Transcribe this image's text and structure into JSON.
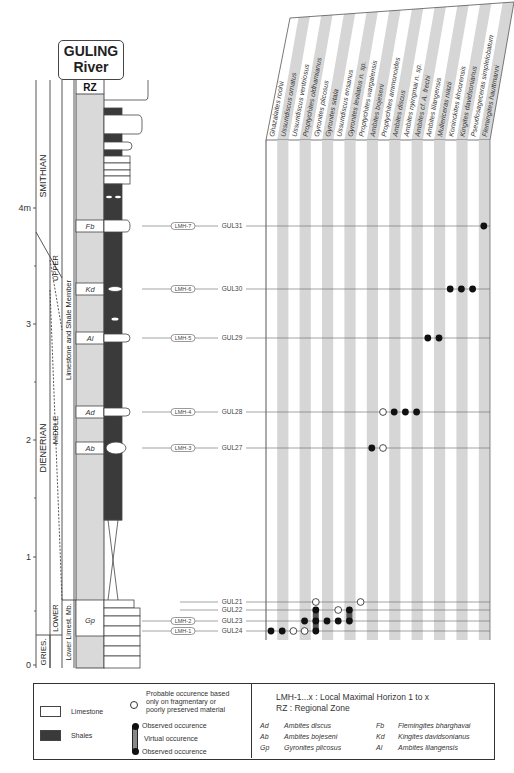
{
  "title": {
    "line1": "GULING",
    "line2": "River"
  },
  "rz_header": "RZ",
  "stages": [
    {
      "label": "SMITHIAN"
    },
    {
      "label": "DIENERIAN"
    },
    {
      "label": "GRIES."
    }
  ],
  "substages": [
    {
      "label": "UPPER"
    },
    {
      "label": "MIDDLE"
    },
    {
      "label": "LOWER"
    }
  ],
  "members": [
    {
      "label": "Limestone and Shale Member"
    },
    {
      "label": "Lower Limest. Mb."
    }
  ],
  "scale": {
    "unit_label": "4m",
    "ticks": [
      {
        "value": "0",
        "y": 665
      },
      {
        "value": "1",
        "y": 557
      },
      {
        "value": "2",
        "y": 440
      },
      {
        "value": "3",
        "y": 324
      },
      {
        "value": "4m",
        "y": 208
      }
    ]
  },
  "zones": [
    {
      "code": "Fb",
      "y": 226
    },
    {
      "code": "Kd",
      "y": 289
    },
    {
      "code": "Al",
      "y": 338
    },
    {
      "code": "Ad",
      "y": 412
    },
    {
      "code": "Ab",
      "y": 448
    },
    {
      "code": "Gp",
      "y": 620
    }
  ],
  "species": [
    "Ghazalaites roohii",
    "Ussuridiscus ornatus",
    "Ussuridiscus ventriosus",
    "Proptychites oldhamianus",
    "Gyronites plicosus",
    "Gyronites sitala",
    "Ussuridiscus ensanus",
    "Gyronites levilatus n. sp.",
    "Proptychites wargalensis",
    "Ambites bojeseni",
    "Proptychites ammonoides",
    "Ambites discus",
    "Ambites nyingmai n. sp.",
    "Ambites cf. A. frechi",
    "Ambites lilangensis",
    "Mullericeras niazii",
    "Koninckites khoorensis",
    "Kingites davidsonianus",
    "Pseudosageceras simplelobatum",
    "Flemingites hauttmanni"
  ],
  "horizons": [
    {
      "lmh": "LMH-7",
      "gul": "GUL31",
      "y": 226
    },
    {
      "lmh": "LMH-6",
      "gul": "GUL30",
      "y": 289
    },
    {
      "lmh": "LMH-5",
      "gul": "GUL29",
      "y": 338
    },
    {
      "lmh": "LMH-4",
      "gul": "GUL28",
      "y": 412
    },
    {
      "lmh": "LMH-3",
      "gul": "GUL27",
      "y": 448
    },
    {
      "lmh": "",
      "gul": "GUL21",
      "y": 602
    },
    {
      "lmh": "",
      "gul": "GUL22",
      "y": 610
    },
    {
      "lmh": "LMH-2",
      "gul": "GUL23",
      "y": 621
    },
    {
      "lmh": "LMH-1",
      "gul": "GUL24",
      "y": 631
    }
  ],
  "chart_data": {
    "type": "range-chart",
    "title": "GULING River",
    "ylabel": "Thickness (m)",
    "ylim": [
      0,
      4.8
    ],
    "taxa": [
      "Ghazalaites roohii",
      "Ussuridiscus ornatus",
      "Ussuridiscus ventriosus",
      "Proptychites oldhamianus",
      "Gyronites plicosus",
      "Gyronites sitala",
      "Ussuridiscus ensanus",
      "Gyronites levilatus n. sp.",
      "Proptychites wargalensis",
      "Ambites bojeseni",
      "Proptychites ammonoides",
      "Ambites discus",
      "Ambites nyingmai n. sp.",
      "Ambites cf. A. frechi",
      "Ambites lilangensis",
      "Mullericeras niazii",
      "Koninckites khoorensis",
      "Kingites davidsonianus",
      "Pseudosageceras simplelobatum",
      "Flemingites hauttmanni"
    ],
    "occurrences": [
      {
        "sample": "GUL24",
        "horizon": "LMH-1",
        "observed": [
          0,
          1,
          4
        ],
        "probable": [
          2,
          3
        ]
      },
      {
        "sample": "GUL23",
        "horizon": "LMH-2",
        "observed": [
          3,
          4,
          5,
          6,
          7
        ],
        "probable": []
      },
      {
        "sample": "GUL22",
        "horizon": "",
        "observed": [
          4,
          7
        ],
        "probable": [
          6
        ]
      },
      {
        "sample": "GUL21",
        "horizon": "",
        "observed": [],
        "probable": [
          4,
          8
        ]
      },
      {
        "sample": "GUL27",
        "horizon": "LMH-3",
        "observed": [
          9
        ],
        "probable": [
          10
        ]
      },
      {
        "sample": "GUL28",
        "horizon": "LMH-4",
        "observed": [
          11,
          12,
          13
        ],
        "probable": [
          10
        ]
      },
      {
        "sample": "GUL29",
        "horizon": "LMH-5",
        "observed": [
          14,
          15
        ],
        "probable": []
      },
      {
        "sample": "GUL30",
        "horizon": "LMH-6",
        "observed": [
          16,
          17,
          18
        ],
        "probable": []
      },
      {
        "sample": "GUL31",
        "horizon": "LMH-7",
        "observed": [
          19
        ],
        "probable": []
      }
    ]
  },
  "legend": {
    "limestone": "Limestone",
    "shales": "Shales",
    "probable": "Probable occurence based only on fragmentary or poorly preserved material",
    "probable_l1": "Probable occurence based",
    "probable_l2": "only on fragmentary or",
    "probable_l3": "poorly preserved material",
    "observed_top": "Observed occurence",
    "virtual": "Virtual occurence",
    "observed_bottom": "Observed occurence",
    "lmh_def": "LMH-1...x : Local Maximal Horizon 1 to x",
    "rz_def": "RZ : Regional Zone",
    "abbreviations": [
      {
        "code": "Ad",
        "name": "Ambites discus"
      },
      {
        "code": "Ab",
        "name": "Ambites bojeseni"
      },
      {
        "code": "Gp",
        "name": "Gyronites plicosus"
      },
      {
        "code": "Fb",
        "name": "Flemingites bharghavai"
      },
      {
        "code": "Kd",
        "name": "Kingites davidsonianus"
      },
      {
        "code": "Al",
        "name": "Ambites lilangensis"
      }
    ]
  },
  "colors": {
    "stripe": "#d6d6d6",
    "rz_fill": "#d9d9d9",
    "shale": "#3a3a3a",
    "line": "#444444",
    "dot": "#111111"
  }
}
